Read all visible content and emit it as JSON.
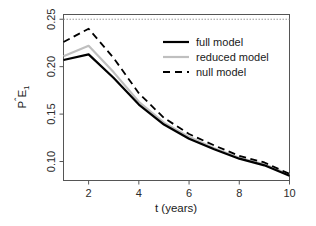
{
  "chart_data": {
    "type": "line",
    "title": "",
    "subtitle": "",
    "xlabel": "t (years)",
    "ylabel": "PÊ₁",
    "x": [
      1,
      2,
      3,
      4,
      5,
      6,
      7,
      8,
      9,
      10
    ],
    "xlim": [
      1,
      10
    ],
    "ylim": [
      0.08,
      0.255
    ],
    "xticks": [
      2,
      4,
      6,
      8,
      10
    ],
    "xtick_labels": [
      "2",
      "4",
      "6",
      "8",
      "10"
    ],
    "yticks": [
      0.1,
      0.15,
      0.2,
      0.25
    ],
    "ytick_labels": [
      "0.10",
      "0.15",
      "0.20",
      "0.25"
    ],
    "grid": false,
    "legend_position": "top-right",
    "series": [
      {
        "name": "full model",
        "values": [
          0.207,
          0.213,
          0.188,
          0.16,
          0.139,
          0.124,
          0.113,
          0.103,
          0.096,
          0.085
        ],
        "color": "#000000",
        "style": "solid",
        "width": 2.2
      },
      {
        "name": "reduced model",
        "values": [
          0.211,
          0.222,
          0.194,
          0.163,
          0.141,
          0.126,
          0.114,
          0.104,
          0.097,
          0.086
        ],
        "color": "#bfbfbf",
        "style": "solid",
        "width": 2.2
      },
      {
        "name": "null model",
        "values": [
          0.226,
          0.24,
          0.209,
          0.172,
          0.146,
          0.129,
          0.117,
          0.106,
          0.099,
          0.087
        ],
        "color": "#000000",
        "style": "dashed",
        "width": 1.8
      }
    ],
    "reference_lines": [
      {
        "name": "upper reference",
        "orientation": "horizontal",
        "value": 0.25,
        "style": "dotted",
        "color": "#999999"
      }
    ]
  },
  "legend": {
    "entries": [
      {
        "label": "full model"
      },
      {
        "label": "reduced model"
      },
      {
        "label": "null model"
      }
    ]
  },
  "axes": {
    "x_title": "t (years)",
    "y_title": "PÊ₁",
    "y_title_parts": {
      "p": "P",
      "hat": "ˆ",
      "e": "E",
      "sub": "1"
    }
  }
}
